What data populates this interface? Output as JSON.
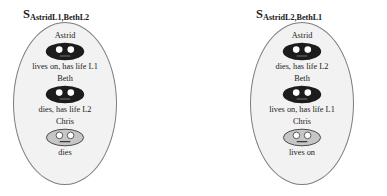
{
  "diagram": {
    "type": "situation-comparison",
    "panels": [
      {
        "id": "panel-left",
        "label": {
          "symbol": "S",
          "subscript": "AstridL1,BethL2"
        },
        "entries": [
          {
            "name": "Astrid",
            "icon": "dark-face-icon",
            "icon_style": "dark",
            "status": "lives on, has life L1"
          },
          {
            "name": "Beth",
            "icon": "dark-face-icon",
            "icon_style": "dark",
            "status": "dies, has life L2"
          },
          {
            "name": "Chris",
            "icon": "light-face-icon",
            "icon_style": "light",
            "status": "dies"
          }
        ]
      },
      {
        "id": "panel-right",
        "label": {
          "symbol": "S",
          "subscript": "AstridL2,BethL1"
        },
        "entries": [
          {
            "name": "Astrid",
            "icon": "dark-face-icon",
            "icon_style": "dark",
            "status": "dies, has life L2"
          },
          {
            "name": "Beth",
            "icon": "dark-face-icon",
            "icon_style": "dark",
            "status": "lives on, has life L1"
          },
          {
            "name": "Chris",
            "icon": "light-face-icon",
            "icon_style": "light",
            "status": "lives on"
          }
        ]
      }
    ]
  },
  "colors": {
    "background": "#ffffff",
    "ellipse_fill": "#f2f2f2",
    "ellipse_stroke": "#7d7d7d",
    "face_dark_fill": "#1c1c1c",
    "face_light_fill": "#c6c6c6",
    "face_light_stroke": "#4a4a4a",
    "eye_fill": "#ffffff",
    "text": "#1a1a1a"
  }
}
